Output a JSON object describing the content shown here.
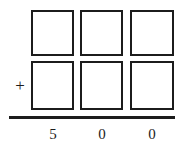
{
  "problem": {
    "operator": "+",
    "operator_name": "plus-sign",
    "columns": [
      "hundreds",
      "tens",
      "ones"
    ],
    "addend_top": {
      "label": "top-addend-row",
      "cells": [
        {
          "column": "hundreds",
          "value": ""
        },
        {
          "column": "tens",
          "value": ""
        },
        {
          "column": "ones",
          "value": ""
        }
      ]
    },
    "addend_bottom": {
      "label": "bottom-addend-row",
      "cells": [
        {
          "column": "hundreds",
          "value": ""
        },
        {
          "column": "tens",
          "value": ""
        },
        {
          "column": "ones",
          "value": ""
        }
      ]
    },
    "sum": {
      "label": "sum-row",
      "digits": [
        "5",
        "0",
        "0"
      ],
      "text": "5 0 0"
    }
  },
  "style": {
    "ink_color": "#1c1c1c",
    "paper_color": "#ffffff"
  }
}
